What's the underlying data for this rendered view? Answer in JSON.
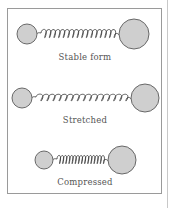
{
  "figure": {
    "panels": [
      {
        "id": "stable",
        "label": "Stable form",
        "small_ball": {
          "cx": 27,
          "cy": 34,
          "r": 10
        },
        "large_ball": {
          "cx": 134,
          "cy": 34,
          "r": 15
        },
        "spring": {
          "x1": 37,
          "x2": 119,
          "coils": 16,
          "amp": 5
        },
        "label_y": 52
      },
      {
        "id": "stretched",
        "label": "Stretched",
        "small_ball": {
          "cx": 22,
          "cy": 98,
          "r": 10
        },
        "large_ball": {
          "cx": 145,
          "cy": 98,
          "r": 14
        },
        "spring": {
          "x1": 32,
          "x2": 131,
          "coils": 15,
          "amp": 4
        },
        "label_y": 115
      },
      {
        "id": "compressed",
        "label": "Compressed",
        "small_ball": {
          "cx": 44,
          "cy": 160,
          "r": 9
        },
        "large_ball": {
          "cx": 122,
          "cy": 160,
          "r": 14
        },
        "spring": {
          "x1": 53,
          "x2": 108,
          "coils": 15,
          "amp": 5
        },
        "label_y": 177
      }
    ],
    "colors": {
      "ball_fill": "#cfcfcf",
      "ball_stroke": "#5a5a5a",
      "spring_stroke": "#3a3a3a",
      "frame": "#9a9a9a",
      "text": "#555555"
    }
  }
}
